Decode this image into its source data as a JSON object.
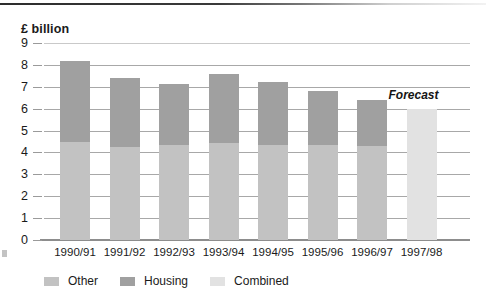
{
  "chart_data": {
    "type": "bar",
    "title": "",
    "ylabel": "£ billion",
    "xlabel": "",
    "ylim": [
      0,
      9
    ],
    "yticks": [
      0,
      1,
      2,
      3,
      4,
      5,
      6,
      7,
      8,
      9
    ],
    "grid": true,
    "stacked": true,
    "legend_position": "bottom-left",
    "categories": [
      "1990/91",
      "1991/92",
      "1992/93",
      "1993/94",
      "1994/95",
      "1995/96",
      "1996/97",
      "1997/98"
    ],
    "series": [
      {
        "name": "Other",
        "color": "#c2c2c2",
        "values": [
          4.5,
          4.25,
          4.35,
          4.45,
          4.35,
          4.35,
          4.3,
          null
        ]
      },
      {
        "name": "Housing",
        "color": "#a0a0a0",
        "values": [
          3.7,
          3.15,
          2.8,
          3.15,
          2.85,
          2.45,
          2.1,
          null
        ]
      },
      {
        "name": "Combined",
        "color": "#e2e2e2",
        "values": [
          null,
          null,
          null,
          null,
          null,
          null,
          null,
          6.0
        ]
      }
    ],
    "totals": [
      8.2,
      7.4,
      7.15,
      7.6,
      7.2,
      6.8,
      6.4,
      6.0
    ],
    "annotations": [
      {
        "text": "Forecast",
        "category": "1997/98",
        "value": 6.6
      }
    ]
  },
  "legend": {
    "items": [
      {
        "label": "Other",
        "color": "#c2c2c2"
      },
      {
        "label": "Housing",
        "color": "#a0a0a0"
      },
      {
        "label": "Combined",
        "color": "#e2e2e2"
      }
    ]
  },
  "colors": {
    "other": "#c2c2c2",
    "housing": "#a0a0a0",
    "combined": "#e2e2e2",
    "gridline": "#a8a8a8",
    "axis": "#8d8d8d",
    "text": "#1a1a1a",
    "background": "#ffffff"
  }
}
